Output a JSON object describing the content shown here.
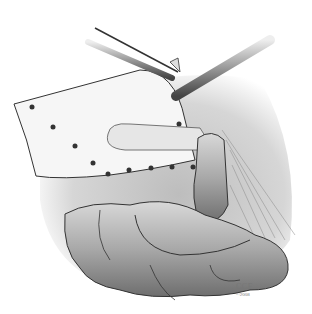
{
  "illustration": {
    "subject": "surgical illustration: mesh sheet held by forceps and probe over small bowel loops",
    "colors": {
      "background": "#ffffff",
      "tissue": "#9a9a9a",
      "mesh": "#f4f4f4",
      "outline": "#333333",
      "dots": "#333333"
    }
  },
  "credit": {
    "main": "CCF",
    "year": "©2008"
  }
}
